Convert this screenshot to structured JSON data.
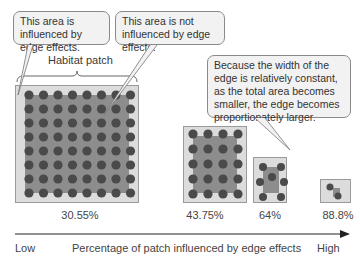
{
  "callouts": {
    "influenced": "This area is influenced by edge effects.",
    "not_influenced": "This area is not influenced by edge effects.",
    "explanation": "Because the width of the edge is relatively constant, as the total area becomes smaller, the edge becomes proportionately larger."
  },
  "habitat_label": "Habitat patch",
  "patches": [
    {
      "id": "large",
      "percent": "30.55%"
    },
    {
      "id": "medium",
      "percent": "43.75%"
    },
    {
      "id": "small",
      "percent": "64%"
    },
    {
      "id": "tiny",
      "percent": "88.8%"
    }
  ],
  "axis": {
    "low": "Low",
    "title": "Percentage of patch influenced by edge effects",
    "high": "High"
  },
  "colors": {
    "edge": "#dcdcdc",
    "core": "#8d8d8d",
    "tree": "#4a4a4a",
    "callout_bg": "#f2f2f2"
  }
}
